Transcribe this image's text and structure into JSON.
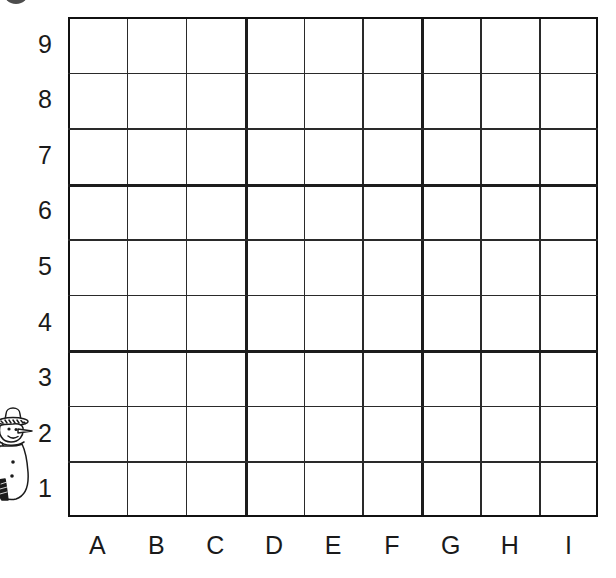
{
  "page": {
    "background_color": "#ffffff",
    "line_color": "#1d1d1d",
    "text_color": "#1a1a1a"
  },
  "corner_mark": {
    "name": "cropped-circle-mark",
    "shape": "circle",
    "color": "#2e2e2e"
  },
  "character": {
    "name": "snowman",
    "description": "line-drawn snowman wearing a brimmed hat, partially cropped at left edge",
    "position": "left margin beside rows 2 and 3"
  },
  "grid": {
    "columns": 9,
    "rows": 9,
    "cell_width": 59,
    "cell_height": 55.5,
    "left": 68,
    "top": 17,
    "right": 598,
    "bottom": 517
  },
  "axes": {
    "column_labels": [
      "A",
      "B",
      "C",
      "D",
      "E",
      "F",
      "G",
      "H",
      "I"
    ],
    "row_labels": [
      "9",
      "8",
      "7",
      "6",
      "5",
      "4",
      "3",
      "2",
      "1"
    ]
  }
}
